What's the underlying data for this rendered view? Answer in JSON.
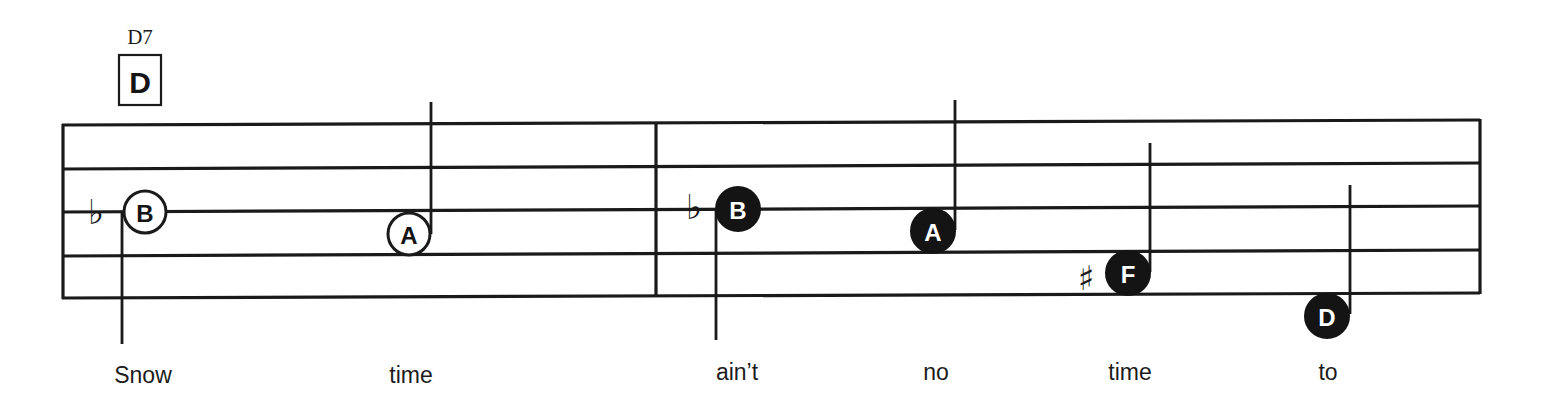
{
  "chord": {
    "name": "D7",
    "root_letter": "D"
  },
  "staff": {
    "lines": 5,
    "measures": 2,
    "line_color": "#1a1a1a"
  },
  "accidentals": {
    "flat": "♭",
    "sharp": "♯"
  },
  "notes": [
    {
      "letter": "B",
      "style": "open",
      "accidental": "flat",
      "stem": "down",
      "lyric": "Snow"
    },
    {
      "letter": "A",
      "style": "open",
      "accidental": "",
      "stem": "up",
      "lyric": "time"
    },
    {
      "letter": "B",
      "style": "filled",
      "accidental": "flat",
      "stem": "down",
      "lyric": "ain’t"
    },
    {
      "letter": "A",
      "style": "filled",
      "accidental": "",
      "stem": "up",
      "lyric": "no"
    },
    {
      "letter": "F",
      "style": "filled",
      "accidental": "sharp",
      "stem": "up",
      "lyric": "time"
    },
    {
      "letter": "D",
      "style": "filled",
      "accidental": "",
      "stem": "up",
      "lyric": "to"
    }
  ],
  "lyrics": [
    "Snow",
    "time",
    "ain’t",
    "no",
    "time",
    "to"
  ]
}
